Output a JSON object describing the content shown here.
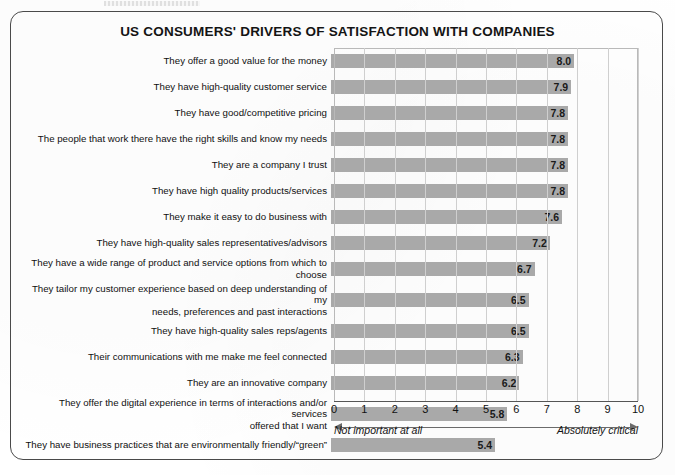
{
  "figure": {
    "title": "US CONSUMERS' DRIVERS OF SATISFACTION WITH COMPANIES",
    "frame_color": "#4a4a4a",
    "bar_color": "#a9a9a9",
    "grid_color": "#cfcfcf"
  },
  "axis": {
    "left_caption": "Not important at all",
    "right_caption": "Absolutely critical",
    "ticks": [
      "0",
      "1",
      "2",
      "3",
      "4",
      "5",
      "6",
      "7",
      "8",
      "9",
      "10"
    ]
  },
  "chart_data": {
    "type": "bar",
    "orientation": "horizontal",
    "title": "US CONSUMERS' DRIVERS OF SATISFACTION WITH COMPANIES",
    "xlabel": "",
    "ylabel": "",
    "xlim": [
      0,
      10
    ],
    "xticks": [
      0,
      1,
      2,
      3,
      4,
      5,
      6,
      7,
      8,
      9,
      10
    ],
    "grid": true,
    "legend": "none",
    "annotations": [
      "Not important at all",
      "Absolutely critical"
    ],
    "categories": [
      "They offer a good value for the money",
      "They have high-quality customer service",
      "They have good/competitive pricing",
      "The people that work there have the right skills and know my needs",
      "They are a company I trust",
      "They have high quality products/services",
      "They make it easy to do business with",
      "They have high-quality sales representatives/advisors",
      "They have a wide range of product and service options from which to choose",
      "They tailor my customer experience based on deep understanding of my\nneeds, preferences and past interactions",
      "They have high-quality sales reps/agents",
      "Their communications with me make me feel connected",
      "They are an innovative company",
      "They offer the digital experience in terms of interactions and/or services\noffered that I want",
      "They have business practices that are environmentally friendly/“green”"
    ],
    "values": [
      8.0,
      7.9,
      7.8,
      7.8,
      7.8,
      7.8,
      7.6,
      7.2,
      6.7,
      6.5,
      6.5,
      6.3,
      6.2,
      5.8,
      5.4
    ],
    "value_labels": [
      "8.0",
      "7.9",
      "7.8",
      "7.8",
      "7.8",
      "7.8",
      "7.6",
      "7.2",
      "6.7",
      "6.5",
      "6.5",
      "6.3",
      "6.2",
      "5.8",
      "5.4"
    ],
    "two_line_rows": [
      9,
      13
    ]
  }
}
